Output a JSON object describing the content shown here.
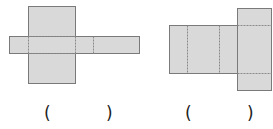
{
  "colors": {
    "fill": "#d9d9d9",
    "stroke": "#7a7a7a",
    "dash": "#8a8a8a"
  },
  "figures": [
    {
      "id": "net-1",
      "solid_rects": [
        {
          "x": 28,
          "y": 6,
          "w": 47,
          "h": 77
        },
        {
          "x": 9,
          "y": 36,
          "w": 130,
          "h": 17
        }
      ],
      "dashed_lines": [
        {
          "x1": 28,
          "y1": 36,
          "x2": 75,
          "y2": 36
        },
        {
          "x1": 28,
          "y1": 53,
          "x2": 75,
          "y2": 53
        },
        {
          "x1": 28,
          "y1": 36,
          "x2": 28,
          "y2": 53
        },
        {
          "x1": 75,
          "y1": 36,
          "x2": 75,
          "y2": 53
        },
        {
          "x1": 93,
          "y1": 36,
          "x2": 93,
          "y2": 53
        }
      ],
      "answer": {
        "open": "(",
        "close": ")",
        "open_x": 44,
        "close_x": 106,
        "y": 105
      }
    },
    {
      "id": "net-2",
      "solid_rects": [
        {
          "x": 169,
          "y": 25,
          "w": 68,
          "h": 48
        },
        {
          "x": 237,
          "y": 8,
          "w": 34,
          "h": 82
        }
      ],
      "dashed_lines": [
        {
          "x1": 187,
          "y1": 25,
          "x2": 187,
          "y2": 73
        },
        {
          "x1": 219,
          "y1": 25,
          "x2": 219,
          "y2": 73
        },
        {
          "x1": 237,
          "y1": 25,
          "x2": 271,
          "y2": 25
        },
        {
          "x1": 237,
          "y1": 73,
          "x2": 271,
          "y2": 73
        }
      ],
      "answer": {
        "open": "(",
        "close": ")",
        "open_x": 185,
        "close_x": 247,
        "y": 105
      }
    }
  ]
}
